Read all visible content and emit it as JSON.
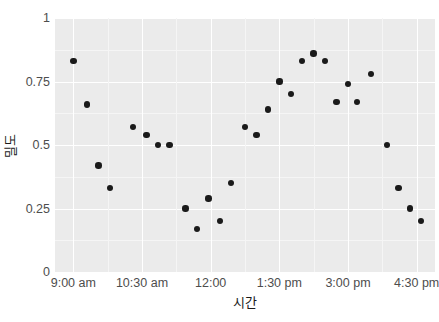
{
  "chart_data": {
    "type": "scatter",
    "title": "",
    "xlabel": "시간",
    "ylabel": "밀도",
    "ylim": [
      0,
      1
    ],
    "grid": true,
    "legend": null,
    "point_color": "#1a1a1a",
    "panel_color": "#ebebeb",
    "gridline_color": "#ffffff",
    "yticks": [
      "0",
      "0.25",
      "0.5",
      "0.75",
      "1"
    ],
    "ytick_values": [
      0,
      0.25,
      0.5,
      0.75,
      1
    ],
    "xticks": [
      "9:00 am",
      "10:30 am",
      "12:00",
      "1:30 pm",
      "3:00 pm",
      "4:30 pm"
    ],
    "xtick_hours": [
      9,
      10.5,
      12,
      13.5,
      15,
      16.5
    ],
    "xlim_hours": [
      8.6,
      16.9
    ],
    "x": [
      9.0,
      9.3,
      9.55,
      9.8,
      10.3,
      10.6,
      10.85,
      11.1,
      11.45,
      11.7,
      11.95,
      12.2,
      12.45,
      12.75,
      13.0,
      13.25,
      13.5,
      13.75,
      14.0,
      14.25,
      14.5,
      14.75,
      15.0,
      15.2,
      15.5,
      15.85,
      16.1,
      16.35,
      16.6
    ],
    "y": [
      0.83,
      0.66,
      0.42,
      0.33,
      0.57,
      0.54,
      0.5,
      0.5,
      0.25,
      0.17,
      0.29,
      0.2,
      0.35,
      0.57,
      0.54,
      0.64,
      0.75,
      0.7,
      0.83,
      0.86,
      0.83,
      0.67,
      0.74,
      0.67,
      0.78,
      0.5,
      0.33,
      0.25,
      0.2
    ],
    "points": [
      {
        "time": "9:00 am",
        "value": 0.83
      },
      {
        "time": "9:18 am",
        "value": 0.66
      },
      {
        "time": "9:33 am",
        "value": 0.42
      },
      {
        "time": "9:48 am",
        "value": 0.33
      },
      {
        "time": "10:18 am",
        "value": 0.57
      },
      {
        "time": "10:36 am",
        "value": 0.54
      },
      {
        "time": "10:51 am",
        "value": 0.5
      },
      {
        "time": "11:06 am",
        "value": 0.5
      },
      {
        "time": "11:27 am",
        "value": 0.25
      },
      {
        "time": "11:42 am",
        "value": 0.17
      },
      {
        "time": "11:57 am",
        "value": 0.29
      },
      {
        "time": "12:12 pm",
        "value": 0.2
      },
      {
        "time": "12:27 pm",
        "value": 0.35
      },
      {
        "time": "12:45 pm",
        "value": 0.57
      },
      {
        "time": "1:00 pm",
        "value": 0.54
      },
      {
        "time": "1:15 pm",
        "value": 0.64
      },
      {
        "time": "1:30 pm",
        "value": 0.75
      },
      {
        "time": "1:45 pm",
        "value": 0.7
      },
      {
        "time": "2:00 pm",
        "value": 0.83
      },
      {
        "time": "2:15 pm",
        "value": 0.86
      },
      {
        "time": "2:30 pm",
        "value": 0.83
      },
      {
        "time": "2:45 pm",
        "value": 0.67
      },
      {
        "time": "3:00 pm",
        "value": 0.74
      },
      {
        "time": "3:12 pm",
        "value": 0.67
      },
      {
        "time": "3:30 pm",
        "value": 0.78
      },
      {
        "time": "3:51 pm",
        "value": 0.5
      },
      {
        "time": "4:06 pm",
        "value": 0.33
      },
      {
        "time": "4:21 pm",
        "value": 0.25
      },
      {
        "time": "4:36 pm",
        "value": 0.2
      }
    ]
  }
}
